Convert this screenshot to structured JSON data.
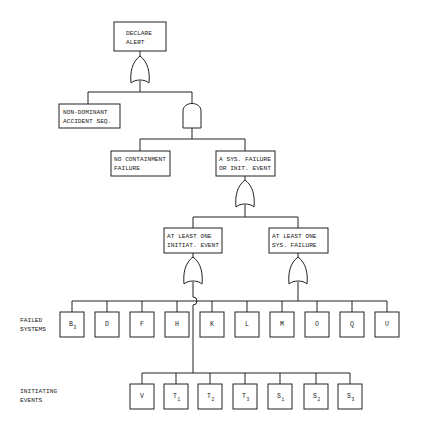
{
  "diagram": {
    "type": "fault-tree",
    "top_event": {
      "line1": "DECLARE",
      "line2": "ALERT"
    },
    "gates": [
      {
        "id": "g1",
        "type": "OR",
        "under": "top_event"
      },
      {
        "id": "g2",
        "type": "AND",
        "under": "g1"
      },
      {
        "id": "g3",
        "type": "OR",
        "under": "sys_or_init"
      },
      {
        "id": "g4",
        "type": "OR",
        "under": "at_least_one_init"
      },
      {
        "id": "g5",
        "type": "OR",
        "under": "at_least_one_sys"
      }
    ],
    "events": {
      "non_dominant": {
        "line1": "NON-DOMINANT",
        "line2": "ACCIDENT SEQ."
      },
      "no_containment": {
        "line1": "NO CONTAINMENT",
        "line2": "FAILURE"
      },
      "sys_or_init": {
        "line1": "A SYS. FAILURE",
        "line2": "OR INIT. EVENT"
      },
      "at_least_one_init": {
        "line1": "AT LEAST ONE",
        "line2": "INITIAT. EVENT"
      },
      "at_least_one_sys": {
        "line1": "AT LEAST ONE",
        "line2": "SYS. FAILURE"
      }
    },
    "row_labels": {
      "failed_systems": {
        "line1": "FAILED",
        "line2": "SYSTEMS"
      },
      "initiating_events": {
        "line1": "INITIATING",
        "line2": "EVENTS"
      }
    },
    "failed_systems": [
      {
        "label": "B",
        "sub": "3"
      },
      {
        "label": "D",
        "sub": ""
      },
      {
        "label": "F",
        "sub": ""
      },
      {
        "label": "H",
        "sub": ""
      },
      {
        "label": "K",
        "sub": ""
      },
      {
        "label": "L",
        "sub": ""
      },
      {
        "label": "M",
        "sub": ""
      },
      {
        "label": "O",
        "sub": ""
      },
      {
        "label": "Q",
        "sub": ""
      },
      {
        "label": "U",
        "sub": ""
      }
    ],
    "initiating_events": [
      {
        "label": "V",
        "sub": ""
      },
      {
        "label": "T",
        "sub": "1"
      },
      {
        "label": "T",
        "sub": "2"
      },
      {
        "label": "T",
        "sub": "3"
      },
      {
        "label": "S",
        "sub": "1"
      },
      {
        "label": "S",
        "sub": "2"
      },
      {
        "label": "S",
        "sub": "3"
      }
    ]
  }
}
